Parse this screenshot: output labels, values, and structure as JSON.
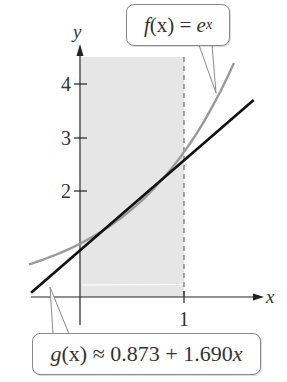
{
  "chart_data": {
    "type": "line",
    "title": "",
    "xlabel": "x",
    "ylabel": "y",
    "x_ticks": [
      1
    ],
    "x_tick_labels": [
      "1"
    ],
    "y_ticks": [
      2,
      3,
      4
    ],
    "y_tick_labels": [
      "2",
      "3",
      "4"
    ],
    "xlim": [
      -0.49,
      1.7
    ],
    "ylim": [
      0,
      4.5
    ],
    "grid": false,
    "shaded_region": {
      "x_from": 0,
      "x_to": 1,
      "y_from": 0,
      "y_to": 4.5,
      "color": "#e6e6e6"
    },
    "series": [
      {
        "name": "f(x) = e^x",
        "function": "exp(x)",
        "x_range": [
          -0.49,
          1.48
        ],
        "color": "#9a9a9a"
      },
      {
        "name": "g(x) ≈ 0.873 + 1.690x",
        "function": "0.873 + 1.690*x",
        "intercept": 0.873,
        "slope": 1.69,
        "x_range": [
          -0.47,
          1.67
        ],
        "color": "#111111"
      }
    ],
    "annotations": [
      {
        "text": "f(x) = e^x",
        "points_to": "exp curve near x=1.3"
      },
      {
        "text": "g(x) ≈ 0.873 + 1.690x",
        "points_to": "linear line near x=-0.29"
      }
    ]
  },
  "labels": {
    "x_axis": "x",
    "y_axis": "y",
    "tick_x1": "1",
    "tick_y2": "2",
    "tick_y3": "3",
    "tick_y4": "4",
    "f_name": "f",
    "f_arg": "(x) = ",
    "f_base": "e",
    "f_exp": "x",
    "g_name": "g",
    "g_arg": "(x) ≈ 0.873 + 1.690",
    "g_var": "x"
  }
}
